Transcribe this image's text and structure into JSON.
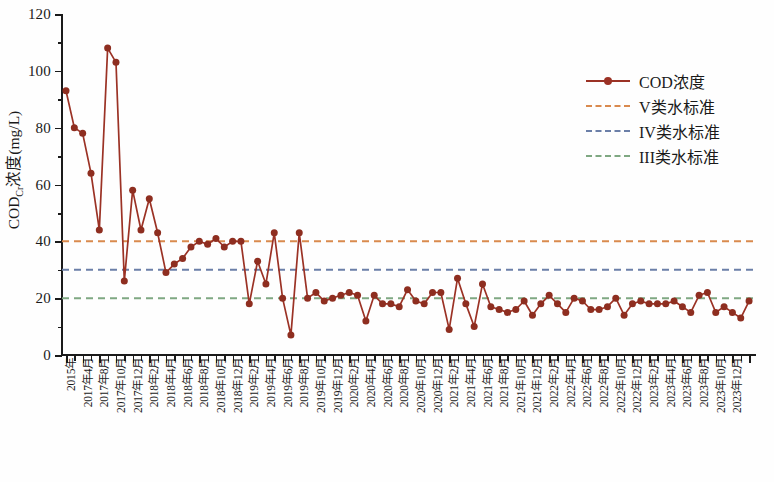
{
  "chart_data": {
    "type": "line",
    "title": "",
    "xlabel": "",
    "ylabel": "CODCr浓度(mg/L)",
    "ylabel_main": "COD",
    "ylabel_sub": "Cr",
    "ylabel_rest": "浓度(mg/L)",
    "ylim": [
      0,
      120
    ],
    "ytick_values": [
      0,
      20,
      40,
      60,
      80,
      100,
      120
    ],
    "ytick_labels": [
      "0",
      "20",
      "40",
      "60",
      "80",
      "100",
      "120"
    ],
    "yminor_step": 10,
    "grid": false,
    "legend_position": "upper-right",
    "series": [
      {
        "name": "COD浓度",
        "style": "line-marker",
        "color": "#9B3225",
        "marker_color": "#8E2E20",
        "x": [
          "2015年",
          "2017年3月",
          "2017年4月",
          "2017年5月",
          "2017年6月",
          "2017年7月",
          "2017年8月",
          "2017年9月",
          "2017年10月",
          "2017年11月",
          "2017年12月",
          "2018年1月",
          "2018年2月",
          "2018年3月",
          "2018年4月",
          "2018年5月",
          "2018年6月",
          "2018年7月",
          "2018年8月",
          "2018年9月",
          "2018年10月",
          "2018年11月",
          "2018年12月",
          "2019年1月",
          "2019年2月",
          "2019年3月",
          "2019年4月",
          "2019年5月",
          "2019年6月",
          "2019年7月",
          "2019年8月",
          "2019年9月",
          "2019年10月",
          "2019年11月",
          "2019年12月",
          "2020年1月",
          "2020年2月",
          "2020年3月",
          "2020年4月",
          "2020年5月",
          "2020年6月",
          "2020年7月",
          "2020年8月",
          "2020年9月",
          "2020年10月",
          "2020年11月",
          "2020年12月",
          "2021年1月",
          "2021年2月",
          "2021年3月",
          "2021年4月",
          "2021年5月",
          "2021年6月",
          "2021年7月",
          "2021年8月",
          "2021年9月",
          "2021年10月",
          "2021年11月",
          "2021年12月",
          "2022年1月",
          "2022年2月",
          "2022年3月",
          "2022年4月",
          "2022年5月",
          "2022年6月",
          "2022年7月",
          "2022年8月",
          "2022年9月",
          "2022年10月",
          "2022年11月",
          "2022年12月",
          "2023年1月",
          "2023年2月",
          "2023年3月",
          "2023年4月",
          "2023年5月",
          "2023年6月",
          "2023年7月",
          "2023年8月",
          "2023年9月",
          "2023年10月",
          "2023年11月",
          "2023年12月"
        ],
        "values": [
          93,
          80,
          78,
          64,
          44,
          108,
          103,
          26,
          58,
          44,
          55,
          43,
          29,
          32,
          34,
          38,
          40,
          39,
          41,
          38,
          40,
          40,
          18,
          33,
          25,
          43,
          20,
          7,
          43,
          20,
          22,
          19,
          20,
          21,
          22,
          21,
          12,
          21,
          18,
          18,
          17,
          23,
          19,
          18,
          22,
          22,
          9,
          27,
          18,
          10,
          25,
          17,
          16,
          15,
          16,
          19,
          14,
          18,
          21,
          18,
          15,
          20,
          19,
          16,
          16,
          17,
          20,
          14,
          18,
          19,
          18,
          18,
          18,
          19,
          17,
          15,
          21,
          22,
          15,
          17,
          15,
          13,
          19
        ]
      }
    ],
    "reference_lines": [
      {
        "name": "V类水标准",
        "value": 40,
        "color": "#D98A4E",
        "style": "dashed"
      },
      {
        "name": "IV类水标准",
        "value": 30,
        "color": "#6B7FA8",
        "style": "dashed"
      },
      {
        "name": "III类水标准",
        "value": 20,
        "color": "#7FA882",
        "style": "dashed"
      }
    ],
    "xtick_labels": [
      "2015年",
      "2017年4月",
      "2017年8月",
      "2017年10月",
      "2017年12月",
      "2018年2月",
      "2018年4月",
      "2018年6月",
      "2018年8月",
      "2018年10月",
      "2018年12月",
      "2019年2月",
      "2019年4月",
      "2019年6月",
      "2019年8月",
      "2019年10月",
      "2019年12月",
      "2020年2月",
      "2020年4月",
      "2020年6月",
      "2020年8月",
      "2020年10月",
      "2020年12月",
      "2021年2月",
      "2021年4月",
      "2021年6月",
      "2021年8月",
      "2021年10月",
      "2021年12月",
      "2022年2月",
      "2022年4月",
      "2022年6月",
      "2022年8月",
      "2022年10月",
      "2022年12月",
      "2023年2月",
      "2023年4月",
      "2023年6月",
      "2023年8月",
      "2023年10月",
      "2023年12月"
    ]
  },
  "legend": {
    "items": [
      {
        "label": "COD浓度",
        "color": "#9B3225",
        "marker": true,
        "dashed": false
      },
      {
        "label": "V类水标准",
        "color": "#D98A4E",
        "marker": false,
        "dashed": true
      },
      {
        "label": "IV类水标准",
        "color": "#6B7FA8",
        "marker": false,
        "dashed": true
      },
      {
        "label": "III类水标准",
        "color": "#7FA882",
        "marker": false,
        "dashed": true
      }
    ]
  }
}
